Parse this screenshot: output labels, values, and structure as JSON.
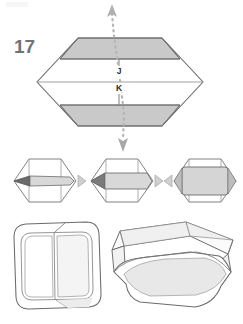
{
  "page": {
    "width": 243,
    "height": 324,
    "background_color": "#ffffff",
    "kind": "origami-instruction-diagram"
  },
  "step": {
    "number": "17",
    "number_color": "#6f7376"
  },
  "palette": {
    "outline": "#6b6b6b",
    "outline_dark": "#4a4a4a",
    "shaded_panel": "#c9c9c9",
    "light_panel": "#d8d8d8",
    "pale_panel": "#ededed",
    "white_panel": "#ffffff",
    "crease": "#8e8e8e",
    "arrow_dotted": "#b0b0b0",
    "arrow_solid": "#9a9a9a",
    "label_text": "#2b2b2b",
    "tip_dark": "#6a6a6a"
  },
  "main_figure": {
    "name": "hexagonal-flattened-model",
    "description": "Large flattened hexagon with shaded top and bottom bands and horizontal crease lines",
    "point_labels": [
      {
        "id": "J",
        "label": "J",
        "x": 119,
        "y": 73
      },
      {
        "id": "K",
        "label": "K",
        "x": 119,
        "y": 90
      }
    ],
    "arrows": [
      {
        "id": "up-arrow",
        "direction": "up",
        "style": "dotted",
        "label": "pull upward"
      },
      {
        "id": "down-arrow",
        "direction": "down",
        "style": "dotted",
        "label": "pull downward"
      }
    ]
  },
  "middle_row": {
    "name": "cross-section-sequence",
    "shapes": [
      {
        "id": "shape-1",
        "label": "hexagon with tapered point at left"
      },
      {
        "id": "shape-2",
        "label": "hexagon with thick band and arrow at left"
      },
      {
        "id": "shape-3",
        "label": "hexagon with filled rounded panel"
      }
    ],
    "separators": [
      {
        "id": "separator-1",
        "direction": "right"
      },
      {
        "id": "separator-2",
        "direction": "left"
      },
      {
        "id": "separator-3",
        "direction": "right"
      },
      {
        "id": "separator-4",
        "direction": "left"
      }
    ]
  },
  "bottom_row": {
    "name": "result-views",
    "shapes": [
      {
        "id": "flat-box-view",
        "label": "flattened rounded box, top view"
      },
      {
        "id": "three-d-box-view",
        "label": "open box in three-quarter perspective"
      }
    ]
  }
}
